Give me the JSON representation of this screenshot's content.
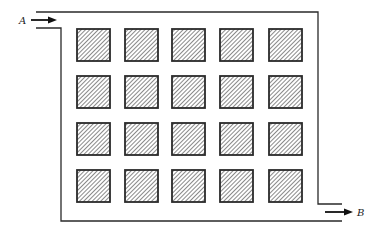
{
  "diagram": {
    "type": "flow-channel-with-obstacle-array",
    "inlet": {
      "label": "A",
      "direction": "right",
      "position": "top-left"
    },
    "outlet": {
      "label": "B",
      "direction": "right",
      "position": "bottom-right"
    },
    "obstacles": {
      "rows": 4,
      "columns": 5,
      "shape": "square",
      "fill": "diagonal-hatch",
      "column_x": [
        77,
        125,
        172,
        220,
        269
      ],
      "row_y": [
        29,
        76,
        123,
        170
      ],
      "size": 33
    },
    "colors": {
      "line": "#2a2a2a",
      "hatch": "#555555",
      "background": "#ffffff"
    }
  }
}
